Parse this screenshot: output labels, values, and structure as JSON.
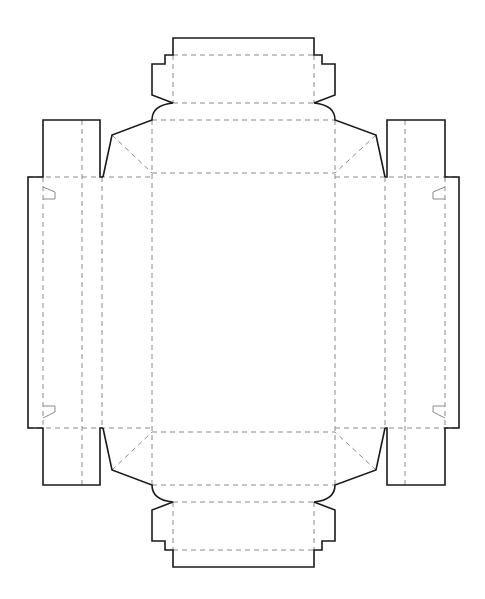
{
  "diagram": {
    "type": "box-dieline",
    "width": 485,
    "height": 599,
    "colors": {
      "cut_line": "#1a1a1a",
      "fold_line": "#8a8a8a",
      "background": "#ffffff"
    },
    "legend": {
      "cut_line": "solid",
      "fold_line": "dashed"
    },
    "cut_paths": [
      {
        "name": "outline-top",
        "d": "M103,177 L112,135 L152,120 Q152,105 173,103 L152,95 L152,64 L165,64 L165,55 L173,55 L173,38 L314,38 L314,55 L322,55 L322,64 L335,64 L335,95 L314,103 Q335,105 335,120 L376,135 L385,177"
      },
      {
        "name": "outline-bottom",
        "d": "M103,428 L112,470 L152,485 Q152,500 173,502 L152,510 L152,541 L165,541 L165,550 L173,550 L173,567 L314,567 L314,550 L322,550 L322,541 L335,541 L335,510 L314,502 Q335,500 335,485 L376,470 L385,428"
      },
      {
        "name": "left-panel",
        "d": "M103,177 L100,177 L100,120 L43,120 L43,177 L28,177 L28,428 L43,428 L43,485 L100,485 L100,428 L103,428"
      },
      {
        "name": "right-panel",
        "d": "M385,177 L387,177 L387,120 L445,120 L445,177 L459,177 L459,428 L445,428 L445,485 L387,485 L387,428 L385,428"
      }
    ],
    "fold_lines": [
      {
        "name": "top-tab-fold",
        "d": "M173,55 L314,55"
      },
      {
        "name": "top-tab-side-left",
        "d": "M173,55 L173,103"
      },
      {
        "name": "top-tab-side-right",
        "d": "M314,55 L314,103"
      },
      {
        "name": "top-tab-base",
        "d": "M173,103 L314,103"
      },
      {
        "name": "top-wall-fold",
        "d": "M152,120 L335,120"
      },
      {
        "name": "main-top",
        "d": "M152,173 L335,173"
      },
      {
        "name": "main-bottom",
        "d": "M152,432 L335,432"
      },
      {
        "name": "main-left",
        "d": "M152,120 L152,485"
      },
      {
        "name": "main-right",
        "d": "M335,120 L335,485"
      },
      {
        "name": "bottom-wall-fold",
        "d": "M152,485 L335,485"
      },
      {
        "name": "bottom-tab-base",
        "d": "M173,502 L314,502"
      },
      {
        "name": "bottom-tab-side-left",
        "d": "M173,502 L173,550"
      },
      {
        "name": "bottom-tab-side-right",
        "d": "M314,502 L314,550"
      },
      {
        "name": "bottom-tab-fold",
        "d": "M173,550 L314,550"
      },
      {
        "name": "left-top-fold",
        "d": "M28,177 L152,177"
      },
      {
        "name": "left-bottom-fold",
        "d": "M28,428 L152,428"
      },
      {
        "name": "right-top-fold",
        "d": "M335,177 L459,177"
      },
      {
        "name": "right-bottom-fold",
        "d": "M335,428 L459,428"
      },
      {
        "name": "left-v1",
        "d": "M43,177 L43,428"
      },
      {
        "name": "left-v2",
        "d": "M82,120 L82,485"
      },
      {
        "name": "left-v3",
        "d": "M102,177 L102,428"
      },
      {
        "name": "right-v1",
        "d": "M385,177 L385,428"
      },
      {
        "name": "right-v2",
        "d": "M405,120 L405,485"
      },
      {
        "name": "right-v3",
        "d": "M445,177 L445,428"
      },
      {
        "name": "diag-top-left",
        "d": "M112,135 L152,173"
      },
      {
        "name": "diag-top-right",
        "d": "M376,135 L335,173"
      },
      {
        "name": "diag-bottom-left",
        "d": "M112,470 L152,432"
      },
      {
        "name": "diag-bottom-right",
        "d": "M376,470 L335,432"
      }
    ],
    "slots": [
      {
        "name": "slot-left-top",
        "d": "M43,187 L55,192 L55,199 L43,199"
      },
      {
        "name": "slot-left-bottom",
        "d": "M43,418 L55,412 L55,406 L43,406"
      },
      {
        "name": "slot-right-top",
        "d": "M445,187 L433,192 L433,199 L445,199"
      },
      {
        "name": "slot-right-bottom",
        "d": "M445,418 L433,412 L433,406 L445,406"
      }
    ]
  }
}
